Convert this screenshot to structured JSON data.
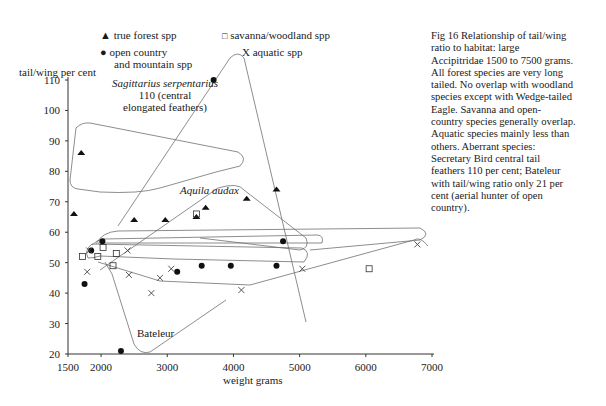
{
  "chart_data": {
    "type": "scatter",
    "xlabel": "weight grams",
    "ylabel": "tail/wing per cent",
    "xlim": [
      1500,
      7000
    ],
    "ylim": [
      20,
      110
    ],
    "x_ticks": [
      1500,
      2000,
      3000,
      4000,
      5000,
      6000,
      7000
    ],
    "y_ticks": [
      20,
      30,
      40,
      50,
      60,
      70,
      80,
      90,
      100,
      110
    ],
    "grid": false,
    "legend_position": "top",
    "series": [
      {
        "name": "true forest spp",
        "marker": "filled-triangle",
        "points": [
          [
            1700,
            86
          ],
          [
            1590,
            66
          ],
          [
            2500,
            64
          ],
          [
            2970,
            64
          ],
          [
            3440,
            65
          ],
          [
            3580,
            68
          ],
          [
            4200,
            71
          ],
          [
            4650,
            74
          ]
        ]
      },
      {
        "name": "savanna/woodland spp",
        "marker": "open-square",
        "points": [
          [
            1720,
            52
          ],
          [
            1950,
            52
          ],
          [
            2030,
            55
          ],
          [
            2180,
            49
          ],
          [
            2230,
            53
          ],
          [
            3440,
            66
          ],
          [
            6050,
            48
          ]
        ]
      },
      {
        "name": "open country and mountain spp",
        "marker": "filled-circle",
        "points": [
          [
            1850,
            54
          ],
          [
            2020,
            57
          ],
          [
            1750,
            43
          ],
          [
            2300,
            21
          ],
          [
            3150,
            47
          ],
          [
            3520,
            49
          ],
          [
            3960,
            49
          ],
          [
            4650,
            49
          ],
          [
            4750,
            57
          ],
          [
            3700,
            110
          ]
        ]
      },
      {
        "name": "aquatic spp",
        "marker": "x",
        "points": [
          [
            1820,
            54
          ],
          [
            1790,
            47
          ],
          [
            2400,
            54
          ],
          [
            2420,
            46
          ],
          [
            2760,
            40
          ],
          [
            2890,
            45
          ],
          [
            3060,
            48
          ],
          [
            4120,
            41
          ],
          [
            5040,
            48
          ],
          [
            6780,
            56
          ]
        ]
      }
    ],
    "annotations": [
      {
        "text": "Sagittarius serpentarius 110 (central elongated feathers)",
        "x": 3700,
        "y": 110
      },
      {
        "text": "Aquila audax",
        "x": 3440,
        "y": 66
      },
      {
        "text": "Bateleur",
        "x": 2300,
        "y": 21
      }
    ]
  },
  "legend": {
    "forest": "true forest spp",
    "savanna": "savanna/woodland spp",
    "open_line1": "open country",
    "open_line2": "and mountain spp",
    "aquatic": "aquatic spp"
  },
  "axes": {
    "ylabel": "tail/wing per cent",
    "xlabel": "weight grams"
  },
  "annotations": {
    "sagittarius_name": "Sagittarius serpentarius",
    "sagittarius_line2": "110 (central",
    "sagittarius_line3": "elongated feathers)",
    "aquila": "Aquila audax",
    "bateleur": "Bateleur"
  },
  "caption": {
    "lines": [
      "Fig 16 Relationship of tail/wing",
      "ratio to habitat: large",
      "Accipitridae 1500 to 7500 grams.",
      "All forest species are very long",
      "tailed. No overlap with woodland",
      "species except with Wedge-tailed",
      "Eagle. Savanna and open-",
      "country species generally overlap.",
      "Aquatic species mainly less than",
      "others. Aberrant species:",
      "Secretary Bird central tail",
      "feathers 110 per cent; Bateleur",
      "with tail/wing ratio only 21 per",
      "cent (aerial hunter of open",
      "country)."
    ]
  }
}
